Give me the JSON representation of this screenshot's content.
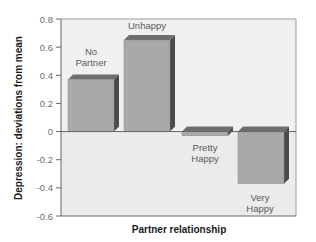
{
  "chart_data": {
    "type": "bar",
    "title": "",
    "xlabel": "Partner relationship",
    "ylabel": "Depression: deviations from mean",
    "categories": [
      "No Partner",
      "Unhappy",
      "Pretty Happy",
      "Very Happy"
    ],
    "category_label_lines": [
      [
        "No",
        "Partner"
      ],
      [
        "Unhappy"
      ],
      [
        "Pretty",
        "Happy"
      ],
      [
        "Very",
        "Happy"
      ]
    ],
    "values": [
      0.37,
      0.65,
      -0.03,
      -0.37
    ],
    "ylim": [
      -0.6,
      0.8
    ],
    "yticks": [
      0.8,
      0.6,
      0.4,
      0.2,
      0,
      -0.2,
      -0.4,
      -0.6
    ],
    "ytick_labels": [
      "0.8",
      "0.6",
      "0.4",
      "0.2",
      "0",
      "-0.2",
      "-0.4",
      "-0.6"
    ],
    "grid": false,
    "legend": null,
    "style": "3d-bars",
    "colors": {
      "bar_front": "#a9a9a9",
      "bar_side": "#4a4a4a",
      "bar_top": "#6e6e6e",
      "plot_upper_bg": "#f0f0f0",
      "plot_lower_bg": "#ebebeb",
      "axis": "#666666"
    }
  }
}
